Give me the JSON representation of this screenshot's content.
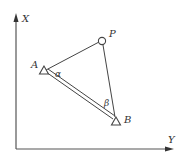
{
  "diagram": {
    "type": "geometry-triangle-with-axes",
    "axes": {
      "vertical": {
        "label": "X"
      },
      "horizontal": {
        "label": "Y"
      }
    },
    "points": [
      {
        "id": "A",
        "label": "A",
        "marker": "triangle"
      },
      {
        "id": "B",
        "label": "B",
        "marker": "triangle"
      },
      {
        "id": "P",
        "label": "P",
        "marker": "circle"
      }
    ],
    "segments": [
      {
        "from": "A",
        "to": "P",
        "style": "single"
      },
      {
        "from": "P",
        "to": "B",
        "style": "single"
      },
      {
        "from": "A",
        "to": "B",
        "style": "double"
      }
    ],
    "angles": [
      {
        "at": "A",
        "label": "α"
      },
      {
        "at": "B",
        "label": "β"
      }
    ],
    "colors": {
      "line": "#444444",
      "axis": "#555555",
      "background": "#ffffff"
    }
  }
}
